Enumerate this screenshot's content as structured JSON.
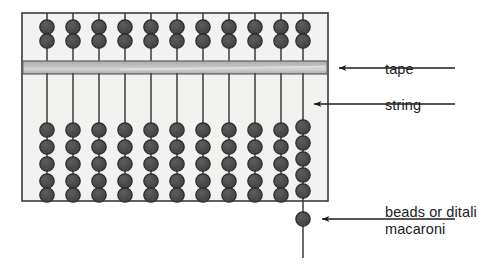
{
  "labels": {
    "tape": "tape",
    "string": "string",
    "beads_line1": "beads or ditali",
    "beads_line2": "macaroni"
  },
  "colors": {
    "frame_fill": "#f2f2f0",
    "frame_stroke": "#3a3a3a",
    "tape_fill": "#b9b9b9",
    "tape_highlight": "#d6d6d6",
    "bead_fill": "#4e4e4e",
    "bead_stroke": "#2b2b2b",
    "string_stroke": "#3a3a3a",
    "text": "#1c1c1c",
    "background": "#ffffff"
  },
  "frame": {
    "x": 22,
    "y": 13,
    "width": 306,
    "height": 188
  },
  "tape": {
    "y": 61,
    "height": 13
  },
  "strings": {
    "count": 11,
    "x_positions": [
      47,
      73,
      99,
      125,
      151,
      177,
      203,
      229,
      255,
      281,
      303
    ],
    "top_beads_per_string": 2,
    "bottom_beads_per_string": 5,
    "bead_radius": 7.2
  },
  "loose_bead": {
    "cx": 303,
    "cy": 219,
    "r": 7.2,
    "string_bottom_y": 258
  },
  "arrows": [
    {
      "name": "tape-arrow",
      "from_x": 455,
      "to_x": 337,
      "y": 68
    },
    {
      "name": "string-arrow",
      "from_x": 455,
      "to_x": 312,
      "y": 104
    },
    {
      "name": "beads-arrow",
      "from_x": 455,
      "to_x": 320,
      "y": 219
    }
  ]
}
